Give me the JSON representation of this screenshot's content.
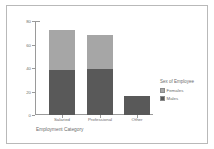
{
  "chart_data": {
    "type": "bar",
    "subtype": "stacked-bar",
    "title": "",
    "xlabel": "Employment Category",
    "ylabel": "Count",
    "categories": [
      "Salaried",
      "Professional",
      "Other"
    ],
    "series": [
      {
        "name": "Males",
        "color": "#595959",
        "values": [
          38,
          39,
          16
        ]
      },
      {
        "name": "Females",
        "color": "#a6a6a6",
        "values": [
          34,
          29,
          0
        ]
      }
    ],
    "stack_order": [
      "Males",
      "Females"
    ],
    "ylim": [
      0,
      80
    ],
    "yticks": [
      0,
      20,
      40,
      60,
      80
    ],
    "ytick_labels": [
      "0",
      "20",
      "40",
      "60",
      "80"
    ],
    "grid": false,
    "legend": {
      "title": "Sex of Employee",
      "position": "right",
      "entries": [
        {
          "label": "Females",
          "color": "#a6a6a6"
        },
        {
          "label": "Males",
          "color": "#595959"
        }
      ]
    },
    "totals": [
      72,
      68,
      16
    ],
    "axis_color": "#9a9a9a",
    "text_color": "#6d6d6d",
    "background": "#ffffff",
    "frame_color": "#b9b9b9"
  }
}
